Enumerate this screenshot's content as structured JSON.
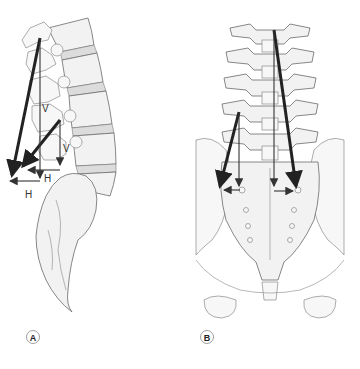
{
  "figure": {
    "panels": [
      {
        "id": "A",
        "label": "A",
        "view": "lateral lumbar spine and sacrum"
      },
      {
        "id": "B",
        "label": "B",
        "view": "posterior lumbar spine and pelvis"
      }
    ],
    "vector_labels": {
      "vertical": "V",
      "horizontal": "H"
    },
    "colors": {
      "arrow": "#222222",
      "bone_fill": "#f2f2f2",
      "bone_stroke": "#6a6a6a",
      "disc_fill": "#dcdcdc"
    }
  }
}
